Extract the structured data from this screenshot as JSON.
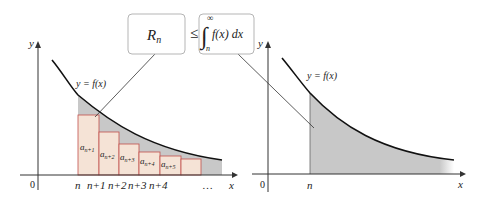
{
  "formula": {
    "left_box": {
      "main": "R",
      "sub": "n"
    },
    "relation": "≤",
    "right_box": {
      "integral_sign": "∫",
      "upper_limit": "∞",
      "lower_limit": "n",
      "integrand": "f(x) dx"
    }
  },
  "left_panel": {
    "y_axis_label": "y",
    "x_axis_label": "x",
    "origin_label": "0",
    "curve_label": "y = f(x)",
    "x_ticks": [
      "n",
      "n+1",
      "n+2",
      "n+3",
      "n+4"
    ],
    "ellipsis": "…",
    "rect_labels": [
      {
        "main": "a",
        "sub": "n+1"
      },
      {
        "main": "a",
        "sub": "n+2"
      },
      {
        "main": "a",
        "sub": "n+3"
      },
      {
        "main": "a",
        "sub": "n+4"
      },
      {
        "main": "a",
        "sub": "n+5"
      }
    ]
  },
  "right_panel": {
    "y_axis_label": "y",
    "x_axis_label": "x",
    "origin_label": "0",
    "curve_label": "y = f(x)",
    "x_tick": "n"
  },
  "colors": {
    "rect_fill": "#f5e3d6",
    "rect_stroke": "#c0504d",
    "gray_fill": "#c8c8c8",
    "curve": "#111111",
    "axis": "#333333",
    "box_stroke": "#b5b5b5"
  }
}
